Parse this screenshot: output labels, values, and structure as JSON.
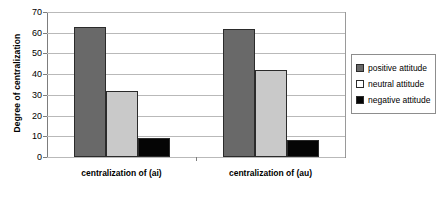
{
  "chart_data": {
    "type": "bar",
    "title": "",
    "xlabel": "",
    "ylabel": "Degree of centralization",
    "ylim": [
      0,
      70
    ],
    "yticks": [
      "0",
      "10",
      "20",
      "30",
      "40",
      "50",
      "60",
      "70"
    ],
    "grid": true,
    "legend_position": "right",
    "categories": [
      "centralization of (ai)",
      "centralization of (au)"
    ],
    "series": [
      {
        "name": "positive attitude",
        "color": "#696969",
        "values": [
          63,
          62
        ]
      },
      {
        "name": "neutral attitude",
        "color": "#c9c9c9",
        "values": [
          32,
          42
        ]
      },
      {
        "name": "negative attitude",
        "color": "#050505",
        "values": [
          9,
          8
        ]
      }
    ]
  },
  "legend": {
    "items": [
      {
        "label": "positive attitude",
        "swatch": "dark-gray-swatch"
      },
      {
        "label": "neutral attitude",
        "swatch": "light-gray-swatch"
      },
      {
        "label": "negative attitude",
        "swatch": "black-swatch"
      }
    ]
  }
}
